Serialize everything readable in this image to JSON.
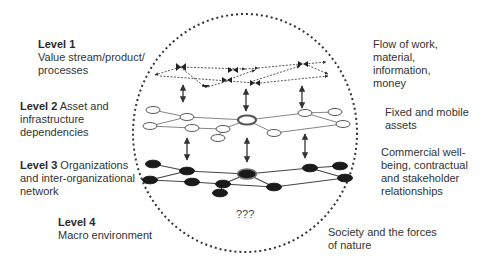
{
  "diagram": {
    "type": "layered network diagram",
    "left_labels": [
      {
        "level": "Level 1",
        "text_lines": [
          "Value stream/product/",
          "processes"
        ]
      },
      {
        "level": "Level 2",
        "text_first": " Asset and",
        "text_lines": [
          "infrastructure",
          "dependencies"
        ]
      },
      {
        "level": "Level 3",
        "text_first": " Organizations",
        "text_lines": [
          "and inter-organizational",
          "network"
        ]
      },
      {
        "level": "Level 4",
        "text_lines": [
          "Macro environment"
        ]
      }
    ],
    "right_labels": [
      {
        "text_lines": [
          "Flow of work,",
          "material,",
          "information,",
          "money"
        ]
      },
      {
        "text_lines": [
          "Fixed and mobile",
          "assets"
        ]
      },
      {
        "text_lines": [
          "Commercial well-",
          "being, contractual",
          "and stakeholder",
          "relationships"
        ]
      },
      {
        "text_lines": [
          "Society and the forces",
          "of nature"
        ]
      }
    ],
    "center_unknown": "???",
    "colors": {
      "text": "#333333",
      "boundary": "#333333",
      "level2_node_fill": "#ffffff",
      "level3_node_fill": "#1a1a1a",
      "edge": "#555555"
    }
  }
}
